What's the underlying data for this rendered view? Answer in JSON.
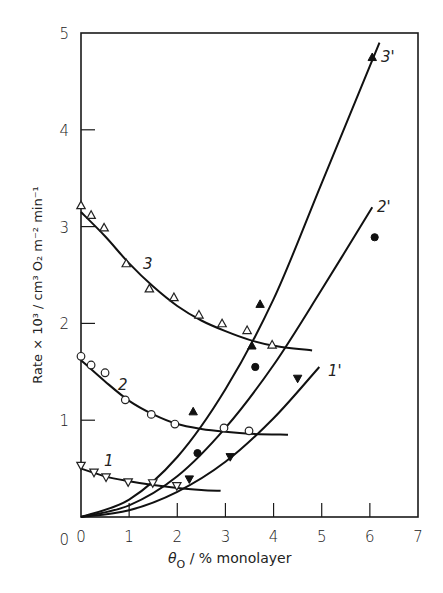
{
  "chart_data": {
    "type": "scatter",
    "title": "",
    "xlabel": "θO / % monolayer",
    "ylabel": "Rate × 10³ / cm³ O₂ m⁻² min⁻¹",
    "xlim": [
      0,
      7
    ],
    "ylim": [
      0,
      5
    ],
    "x_ticks": [
      "0",
      "1",
      "2",
      "3",
      "4",
      "5",
      "6",
      "7"
    ],
    "y_ticks": [
      "0",
      "1",
      "2",
      "3",
      "4",
      "5"
    ],
    "grid": false,
    "legend": "none (curves labelled inline: 1, 2, 3, 1', 2', 3')",
    "series": [
      {
        "name": "1",
        "marker": "open-down-triangle",
        "points": [
          [
            0.0,
            0.53
          ],
          [
            0.27,
            0.46
          ],
          [
            0.52,
            0.41
          ],
          [
            0.98,
            0.36
          ],
          [
            1.49,
            0.35
          ],
          [
            1.99,
            0.32
          ]
        ],
        "fit_curve": [
          [
            0.0,
            0.5
          ],
          [
            0.5,
            0.42
          ],
          [
            1.0,
            0.37
          ],
          [
            1.5,
            0.33
          ],
          [
            2.0,
            0.3
          ],
          [
            2.5,
            0.28
          ],
          [
            2.9,
            0.27
          ]
        ]
      },
      {
        "name": "2",
        "marker": "open-circle",
        "points": [
          [
            0.0,
            1.66
          ],
          [
            0.21,
            1.57
          ],
          [
            0.5,
            1.49
          ],
          [
            0.92,
            1.21
          ],
          [
            1.46,
            1.06
          ],
          [
            1.95,
            0.96
          ],
          [
            2.97,
            0.92
          ],
          [
            3.49,
            0.89
          ]
        ],
        "fit_curve": [
          [
            0.0,
            1.62
          ],
          [
            0.5,
            1.4
          ],
          [
            1.0,
            1.2
          ],
          [
            1.5,
            1.06
          ],
          [
            2.0,
            0.96
          ],
          [
            2.5,
            0.91
          ],
          [
            3.0,
            0.88
          ],
          [
            3.5,
            0.86
          ],
          [
            4.3,
            0.85
          ]
        ]
      },
      {
        "name": "3",
        "marker": "open-up-triangle",
        "points": [
          [
            0.0,
            3.22
          ],
          [
            0.21,
            3.12
          ],
          [
            0.48,
            2.99
          ],
          [
            0.94,
            2.62
          ],
          [
            1.42,
            2.36
          ],
          [
            1.93,
            2.27
          ],
          [
            2.45,
            2.09
          ],
          [
            2.93,
            2.0
          ],
          [
            3.45,
            1.93
          ],
          [
            3.97,
            1.78
          ]
        ],
        "fit_curve": [
          [
            0.0,
            3.15
          ],
          [
            0.5,
            2.9
          ],
          [
            1.0,
            2.62
          ],
          [
            1.5,
            2.38
          ],
          [
            2.0,
            2.18
          ],
          [
            2.5,
            2.03
          ],
          [
            3.0,
            1.92
          ],
          [
            3.5,
            1.83
          ],
          [
            4.0,
            1.77
          ],
          [
            4.8,
            1.72
          ]
        ]
      },
      {
        "name": "1'",
        "marker": "filled-down-triangle",
        "points": [
          [
            2.25,
            0.39
          ],
          [
            3.1,
            0.62
          ],
          [
            4.5,
            1.43
          ]
        ],
        "fit_curve": [
          [
            0.0,
            0.0
          ],
          [
            1.0,
            0.07
          ],
          [
            2.0,
            0.26
          ],
          [
            3.0,
            0.57
          ],
          [
            4.0,
            1.02
          ],
          [
            4.95,
            1.55
          ]
        ]
      },
      {
        "name": "2'",
        "marker": "filled-circle",
        "points": [
          [
            2.42,
            0.66
          ],
          [
            3.62,
            1.55
          ],
          [
            6.1,
            2.89
          ]
        ],
        "fit_curve": [
          [
            0.0,
            0.0
          ],
          [
            1.0,
            0.12
          ],
          [
            2.0,
            0.42
          ],
          [
            3.0,
            0.92
          ],
          [
            4.0,
            1.57
          ],
          [
            5.0,
            2.35
          ],
          [
            6.05,
            3.2
          ]
        ]
      },
      {
        "name": "3'",
        "marker": "filled-up-triangle",
        "points": [
          [
            2.33,
            1.09
          ],
          [
            3.55,
            1.77
          ],
          [
            3.72,
            2.2
          ],
          [
            6.05,
            4.75
          ]
        ],
        "fit_curve": [
          [
            0.0,
            0.0
          ],
          [
            1.0,
            0.18
          ],
          [
            2.0,
            0.62
          ],
          [
            3.0,
            1.32
          ],
          [
            4.0,
            2.25
          ],
          [
            5.0,
            3.45
          ],
          [
            6.2,
            4.9
          ]
        ]
      }
    ]
  },
  "labels": {
    "x_axis": "θ",
    "x_axis_sub": "O",
    "x_axis_rest": " / % monolayer",
    "y_axis": "Rate × 10³ / cm³ O₂ m⁻² min⁻¹",
    "curve_1": "1",
    "curve_2": "2",
    "curve_3": "3",
    "curve_1p": "1'",
    "curve_2p": "2'",
    "curve_3p": "3'"
  }
}
